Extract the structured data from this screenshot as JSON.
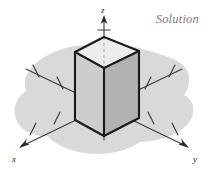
{
  "figure": {
    "title_label": "Solution",
    "kind": "3d-coordinate-axes-with-rectangular-box",
    "background_color": "#ffffff",
    "blob_color": "#d8d8d8",
    "axis_color": "#3a3a3a",
    "outline_color": "#1a1a1a",
    "label_color": "#7c7c7c"
  },
  "axes": [
    {
      "name": "x",
      "label": "x",
      "direction": "lower-left",
      "arrow": true,
      "tick_count": 4,
      "label_pos": {
        "x": 16,
        "y": 158
      }
    },
    {
      "name": "y",
      "label": "y",
      "direction": "lower-right",
      "arrow": true,
      "tick_count": 4,
      "label_pos": {
        "x": 191,
        "y": 158
      }
    },
    {
      "name": "z",
      "label": "z",
      "direction": "up",
      "arrow": true,
      "tick_count": 3,
      "dashed_inside_box": true,
      "label_pos": {
        "x": 104,
        "y": 10
      }
    }
  ],
  "box": {
    "name": "rectangular-prism",
    "faces": {
      "top_color": "#ececec",
      "left_color": "#cfcfcf",
      "right_color": "#b4b4b4"
    },
    "vertices": {
      "top_back": {
        "x": 104,
        "y": 37
      },
      "top_left": {
        "x": 75,
        "y": 52
      },
      "top_front": {
        "x": 104,
        "y": 68
      },
      "top_right": {
        "x": 139,
        "y": 51
      },
      "bottom_left": {
        "x": 75,
        "y": 120
      },
      "bottom_front": {
        "x": 104,
        "y": 136
      },
      "bottom_right": {
        "x": 139,
        "y": 118
      }
    }
  },
  "origin": {
    "x": 104,
    "y": 96
  }
}
